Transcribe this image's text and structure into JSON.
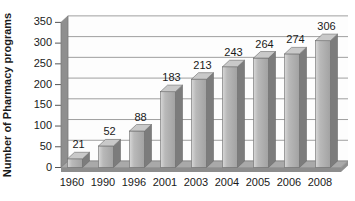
{
  "chart_data": {
    "type": "bar",
    "style": "3d-column",
    "title": "",
    "categories": [
      "1960",
      "1990",
      "1996",
      "2001",
      "2003",
      "2004",
      "2005",
      "2006",
      "2008"
    ],
    "values": [
      21,
      52,
      88,
      183,
      213,
      243,
      264,
      274,
      306
    ],
    "xlabel": "",
    "ylabel": "Number of Pharmacy programs",
    "ylim": [
      0,
      350
    ],
    "ytick_step": 50,
    "yticks": [
      0,
      50,
      100,
      150,
      200,
      250,
      300,
      350
    ],
    "grid": true,
    "legend": "none",
    "data_labels": true
  },
  "colors": {
    "background": "#ffffff",
    "plot_bg": "#fdfdfd",
    "grid": "#9f9f9f",
    "wall": "#8f8f8f",
    "wall_edge": "#7a7a7a",
    "floor": "#a9a9a9",
    "floor_front": "#8d8d8d",
    "bar_front_light": "#d8d8d8",
    "bar_front_mid": "#b9b9b9",
    "bar_front_dark": "#a2a2a2",
    "bar_side": "#7c7c7c",
    "bar_top": "#c9c9c9",
    "bar_edge": "#6a6a6a",
    "tick": "#555555",
    "text": "#1a1a1a"
  }
}
